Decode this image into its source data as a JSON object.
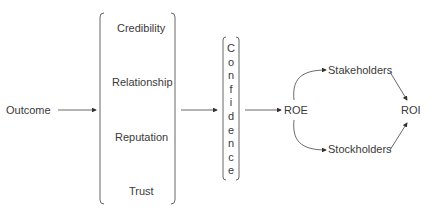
{
  "diagram": {
    "outcome": "Outcome",
    "factors": [
      "Credibility",
      "Relationship",
      "Reputation",
      "Trust"
    ],
    "confidence": "Confidence",
    "roe": "ROE",
    "stakeholders": "Stakeholders",
    "stockholders": "Stockholders",
    "roi": "ROI"
  }
}
